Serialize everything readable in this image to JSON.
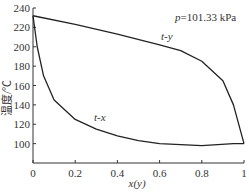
{
  "chart_data": {
    "type": "line",
    "title": "",
    "annotation": "p=101.33 kPa",
    "xlabel": "x(y)",
    "ylabel": "温度/℃",
    "xlim": [
      0,
      1
    ],
    "ylim": [
      80,
      240
    ],
    "x_ticks": [
      "0",
      "0.2",
      "0.4",
      "0.6",
      "0.8",
      "1"
    ],
    "y_ticks": [
      "100",
      "120",
      "140",
      "160",
      "180",
      "200",
      "220",
      "240"
    ],
    "grid": false,
    "series": [
      {
        "name": "t-y",
        "x": [
          0,
          0.2,
          0.4,
          0.6,
          0.7,
          0.8,
          0.9,
          0.95,
          1.0
        ],
        "y": [
          232,
          223,
          213,
          202,
          196,
          185,
          165,
          140,
          100
        ]
      },
      {
        "name": "t-x",
        "x": [
          0,
          0.02,
          0.05,
          0.1,
          0.2,
          0.3,
          0.4,
          0.5,
          0.6,
          0.8,
          0.95,
          1.0
        ],
        "y": [
          232,
          200,
          170,
          145,
          125,
          115,
          108,
          103,
          100,
          98,
          100,
          100
        ]
      }
    ]
  },
  "labels": {
    "ty": "t-y",
    "tx": "t-x",
    "p": "p=101.33 kPa",
    "xlabel": "x(y)",
    "ylabel": "温度/℃"
  }
}
